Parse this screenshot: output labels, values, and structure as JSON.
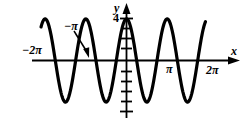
{
  "figure": {
    "background_color": "#ffffff",
    "ink_color": "#000000",
    "width": 249,
    "height": 124
  },
  "axes": {
    "x_axis_label": "x",
    "y_axis_label": "y",
    "x_ticks": [
      {
        "label": "−2π",
        "value": -6.2832
      },
      {
        "label": "π",
        "value": 3.1416
      },
      {
        "label": "2π",
        "value": 6.2832
      }
    ],
    "y_ticks": [
      {
        "label": "4",
        "value": 4
      }
    ],
    "y_tick_count_above": 5,
    "y_tick_count_below": 5,
    "xlim": [
      -7.6,
      7.6
    ],
    "ylim": [
      -5.2,
      5.2
    ],
    "grid": false
  },
  "annotations": [
    {
      "label": "−π",
      "points_to_value": -3.1416,
      "has_arrow": true
    }
  ],
  "chart_data": {
    "type": "line",
    "title": "",
    "subtitle": "",
    "xlabel": "x",
    "ylabel": "y",
    "xlim": [
      -7.6,
      7.6
    ],
    "ylim": [
      -5.2,
      5.2
    ],
    "grid": false,
    "legend": null,
    "series": [
      {
        "name": "y = 4 cos(2x)",
        "equation": "y = 4*cos(2x)",
        "amplitude": 4,
        "period": 3.14159,
        "x_domain": [
          -6.6,
          6.1
        ],
        "color": "#000000",
        "line_width": 3.2,
        "peaks_x": [
          -6.2832,
          -3.1416,
          0,
          3.1416,
          6.2832
        ],
        "peaks_y": [
          4,
          4,
          4,
          4,
          4
        ],
        "valleys_x": [
          -4.7124,
          -1.5708,
          1.5708,
          4.7124
        ],
        "valleys_y": [
          -4,
          -4,
          -4,
          -4
        ],
        "zeros_x": [
          -5.4978,
          -3.927,
          -2.3562,
          -0.7854,
          0.7854,
          2.3562,
          3.927,
          5.4978
        ]
      }
    ]
  }
}
